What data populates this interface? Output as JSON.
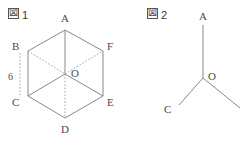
{
  "figures": [
    {
      "caption_mark": "図",
      "caption_number": "1",
      "caption_x": 8,
      "caption_y": 8,
      "vertices": [
        {
          "name": "A",
          "label": "A",
          "x": 65,
          "y": 30,
          "label_x": 61,
          "label_y": 12
        },
        {
          "name": "B",
          "label": "B",
          "x": 28,
          "y": 51,
          "label_x": 12,
          "label_y": 40
        },
        {
          "name": "C",
          "label": "C",
          "x": 28,
          "y": 96,
          "label_x": 12,
          "label_y": 96
        },
        {
          "name": "D",
          "label": "D",
          "x": 65,
          "y": 118,
          "label_x": 61,
          "label_y": 123
        },
        {
          "name": "E",
          "label": "E",
          "x": 103,
          "y": 96,
          "label_x": 107,
          "label_y": 96
        },
        {
          "name": "F",
          "label": "F",
          "x": 103,
          "y": 51,
          "label_x": 107,
          "label_y": 40
        },
        {
          "name": "O",
          "label": "O",
          "x": 65,
          "y": 74,
          "label_x": 71,
          "label_y": 67
        }
      ],
      "solid_edges": [
        {
          "name": "edge-A-B",
          "from": "A",
          "to": "B"
        },
        {
          "name": "edge-B-C",
          "from": "B",
          "to": "C"
        },
        {
          "name": "edge-C-D",
          "from": "C",
          "to": "D"
        },
        {
          "name": "edge-D-E",
          "from": "D",
          "to": "E"
        },
        {
          "name": "edge-E-F",
          "from": "E",
          "to": "F"
        },
        {
          "name": "edge-F-A",
          "from": "F",
          "to": "A"
        },
        {
          "name": "edge-A-O",
          "from": "A",
          "to": "O"
        },
        {
          "name": "edge-C-O",
          "from": "C",
          "to": "O"
        },
        {
          "name": "edge-E-O",
          "from": "E",
          "to": "O"
        }
      ],
      "dotted_edges": [
        {
          "name": "edge-B-O",
          "from": "B",
          "to": "O"
        },
        {
          "name": "edge-O-D",
          "from": "O",
          "to": "D"
        },
        {
          "name": "edge-O-F",
          "from": "O",
          "to": "F"
        }
      ],
      "measure": {
        "name": "measure-B-C",
        "value": "6",
        "label_x": 8,
        "label_y": 71,
        "line_x": 20,
        "line_y1": 53,
        "line_y2": 95
      }
    },
    {
      "caption_mark": "図",
      "caption_number": "2",
      "caption_x": 147,
      "caption_y": 8,
      "vertices": [
        {
          "name": "A",
          "label": "A",
          "x": 203,
          "y": 25,
          "label_x": 199,
          "label_y": 10
        },
        {
          "name": "O",
          "label": "O",
          "x": 203,
          "y": 78,
          "label_x": 208,
          "label_y": 70
        },
        {
          "name": "C",
          "label": "C",
          "x": 179,
          "y": 105,
          "label_x": 164,
          "label_y": 103
        },
        {
          "name": "R",
          "label": "",
          "x": 240,
          "y": 108,
          "label_x": 0,
          "label_y": 0
        }
      ],
      "solid_edges": [
        {
          "name": "edge-A-O",
          "from": "A",
          "to": "O"
        },
        {
          "name": "edge-C-O",
          "from": "C",
          "to": "O"
        },
        {
          "name": "edge-O-R",
          "from": "O",
          "to": "R"
        }
      ],
      "dotted_edges": [],
      "measure": null
    }
  ],
  "style": {
    "line_color": "#7a7a7a",
    "dotted_color": "#9a9a9a",
    "text_color": "#4a4a4a",
    "background": "#ffffff"
  }
}
